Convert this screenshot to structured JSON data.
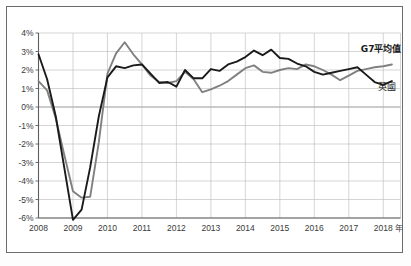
{
  "chart_data": {
    "type": "line",
    "title": "",
    "subtitle": "",
    "xlabel": "年",
    "ylabel": "",
    "xlim": [
      2008,
      2018.5
    ],
    "ylim": [
      -6,
      4
    ],
    "grid": true,
    "legend_position": "inline-right",
    "x_tick_labels": [
      "2008",
      "2009",
      "2010",
      "2011",
      "2012",
      "2013",
      "2014",
      "2015",
      "2016",
      "2017",
      "2018"
    ],
    "x_tick_values": [
      2008,
      2009,
      2010,
      2011,
      2012,
      2013,
      2014,
      2015,
      2016,
      2017,
      2018
    ],
    "y_tick_labels": [
      "4%",
      "3%",
      "2%",
      "1%",
      "0%",
      "-1%",
      "-2%",
      "-3%",
      "-4%",
      "-5%",
      "-6%"
    ],
    "y_tick_values": [
      4,
      3,
      2,
      1,
      0,
      -1,
      -2,
      -3,
      -4,
      -5,
      -6
    ],
    "series": [
      {
        "name": "G7平均值",
        "color": "#808080",
        "label_bold": true,
        "label_x": 2017.35,
        "label_y": 2.95,
        "x": [
          2008.0,
          2008.25,
          2008.5,
          2008.75,
          2009.0,
          2009.25,
          2009.5,
          2009.75,
          2010.0,
          2010.25,
          2010.5,
          2010.75,
          2011.0,
          2011.25,
          2011.5,
          2011.75,
          2012.0,
          2012.25,
          2012.5,
          2012.75,
          2013.0,
          2013.25,
          2013.5,
          2013.75,
          2014.0,
          2014.25,
          2014.5,
          2014.75,
          2015.0,
          2015.25,
          2015.5,
          2015.75,
          2016.0,
          2016.25,
          2016.5,
          2016.75,
          2017.0,
          2017.25,
          2017.5,
          2017.75,
          2018.0,
          2018.25
        ],
        "values": [
          1.4,
          0.9,
          -0.6,
          -2.6,
          -4.55,
          -4.9,
          -4.85,
          -1.9,
          1.8,
          2.9,
          3.5,
          2.85,
          2.3,
          1.7,
          1.35,
          1.3,
          1.4,
          1.9,
          1.5,
          0.8,
          0.95,
          1.15,
          1.4,
          1.75,
          2.1,
          2.25,
          1.9,
          1.85,
          2.0,
          2.1,
          2.05,
          2.3,
          2.2,
          2.0,
          1.75,
          1.45,
          1.7,
          1.95,
          2.05,
          2.15,
          2.2,
          2.3
        ]
      },
      {
        "name": "英國",
        "color": "#1a1a1a",
        "label_bold": false,
        "label_x": 2017.85,
        "label_y": 0.9,
        "x": [
          2008.0,
          2008.25,
          2008.5,
          2008.75,
          2009.0,
          2009.25,
          2009.5,
          2009.75,
          2010.0,
          2010.25,
          2010.5,
          2010.75,
          2011.0,
          2011.25,
          2011.5,
          2011.75,
          2012.0,
          2012.25,
          2012.5,
          2012.75,
          2013.0,
          2013.25,
          2013.5,
          2013.75,
          2014.0,
          2014.25,
          2014.5,
          2014.75,
          2015.0,
          2015.25,
          2015.5,
          2015.75,
          2016.0,
          2016.25,
          2016.5,
          2016.75,
          2017.0,
          2017.25,
          2017.5,
          2017.75,
          2018.0,
          2018.25
        ],
        "values": [
          2.85,
          1.5,
          -0.5,
          -3.3,
          -6.1,
          -5.55,
          -3.25,
          -0.5,
          1.6,
          2.2,
          2.1,
          2.25,
          2.3,
          1.8,
          1.3,
          1.35,
          1.1,
          2.0,
          1.55,
          1.55,
          2.05,
          1.95,
          2.3,
          2.45,
          2.7,
          3.05,
          2.8,
          3.1,
          2.65,
          2.6,
          2.35,
          2.2,
          1.9,
          1.75,
          1.85,
          1.95,
          2.05,
          2.15,
          1.75,
          1.35,
          1.2,
          1.4
        ]
      }
    ]
  },
  "axis": {
    "x_unit": "年"
  }
}
